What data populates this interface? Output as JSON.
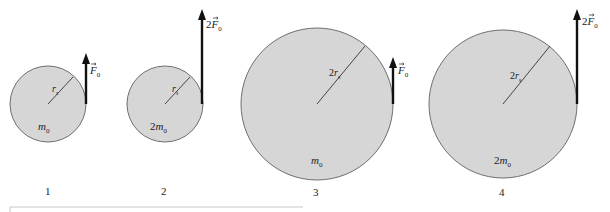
{
  "diagram": {
    "colors": {
      "disk_fill": "#d6d6d6",
      "disk_stroke": "#6e6e6e",
      "arrow": "#111111",
      "text": "#222222",
      "frame_line": "#c8c8c8"
    },
    "disks": [
      {
        "index_label": "1",
        "radius_label": "r",
        "radius_sub": "s",
        "mass_label": "m",
        "mass_prefix": "",
        "mass_sub": "0",
        "force_prefix": "",
        "force_symbol": "F",
        "force_sub": "0",
        "cx": 48,
        "cy": 104,
        "r": 38,
        "arrow_top": 52
      },
      {
        "index_label": "2",
        "radius_label": "r",
        "radius_sub": "s",
        "mass_label": "m",
        "mass_prefix": "2",
        "mass_sub": "0",
        "force_prefix": "2",
        "force_symbol": "F",
        "force_sub": "0",
        "cx": 165,
        "cy": 104,
        "r": 38,
        "arrow_top": 9
      },
      {
        "index_label": "3",
        "radius_label": "r",
        "radius_prefix": "2",
        "radius_sub": "s",
        "mass_label": "m",
        "mass_prefix": "",
        "mass_sub": "0",
        "force_prefix": "",
        "force_symbol": "F",
        "force_sub": "0",
        "cx": 317,
        "cy": 104,
        "r": 76,
        "arrow_top": 56
      },
      {
        "index_label": "4",
        "radius_label": "r",
        "radius_prefix": "2",
        "radius_sub": "s",
        "mass_label": "m",
        "mass_prefix": "2",
        "mass_sub": "0",
        "force_prefix": "2",
        "force_symbol": "F",
        "force_sub": "0",
        "cx": 503,
        "cy": 104,
        "r": 75,
        "arrow_top": 9
      }
    ]
  },
  "labels": {
    "d1": {
      "num": "1",
      "r": "r",
      "rsub": "s",
      "m": "m",
      "msub": "0",
      "f": "F",
      "fsub": "0"
    },
    "d2": {
      "num": "2",
      "r": "r",
      "rsub": "s",
      "mpre": "2",
      "m": "m",
      "msub": "0",
      "fpre": "2",
      "f": "F",
      "fsub": "0"
    },
    "d3": {
      "num": "3",
      "rpre": "2",
      "r": "r",
      "rsub": "s",
      "m": "m",
      "msub": "0",
      "f": "F",
      "fsub": "0"
    },
    "d4": {
      "num": "4",
      "rpre": "2",
      "r": "r",
      "rsub": "s",
      "mpre": "2",
      "m": "m",
      "msub": "0",
      "fpre": "2",
      "f": "F",
      "fsub": "0"
    }
  }
}
